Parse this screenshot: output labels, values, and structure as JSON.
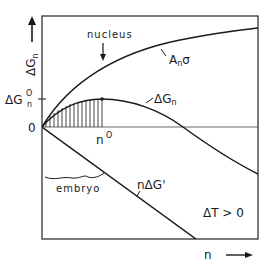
{
  "diagram": {
    "colors": {
      "ink": "#1a1a1a",
      "frame": "#333333",
      "background": "#ffffff"
    },
    "y_axis": {
      "label_main": "ΔG",
      "label_sub": "n",
      "arrow": "up-arrow",
      "ticks": [
        {
          "label_main": "ΔG",
          "label_sub": "n",
          "label_sup": "O",
          "meaning": "critical energy barrier"
        },
        {
          "label": "0"
        }
      ]
    },
    "x_axis": {
      "label": "n",
      "arrow": "right-arrow",
      "ticks": [
        {
          "label_main": "n",
          "label_sup": "O",
          "meaning": "critical size"
        }
      ]
    },
    "annotations": {
      "nucleus": "nucleus",
      "embryo": "embryo",
      "condition": "ΔT > 0"
    },
    "curves": [
      {
        "id": "surface",
        "label_main": "A",
        "label_sub": "n",
        "label_tail": "σ",
        "shape": "concave increasing"
      },
      {
        "id": "total",
        "label_main": "ΔG",
        "label_sub": "n",
        "shape": "rises to maximum at n°, then falls"
      },
      {
        "id": "volume",
        "label_main": "nΔG",
        "label_tail": "'",
        "shape": "straight line decreasing"
      }
    ]
  }
}
